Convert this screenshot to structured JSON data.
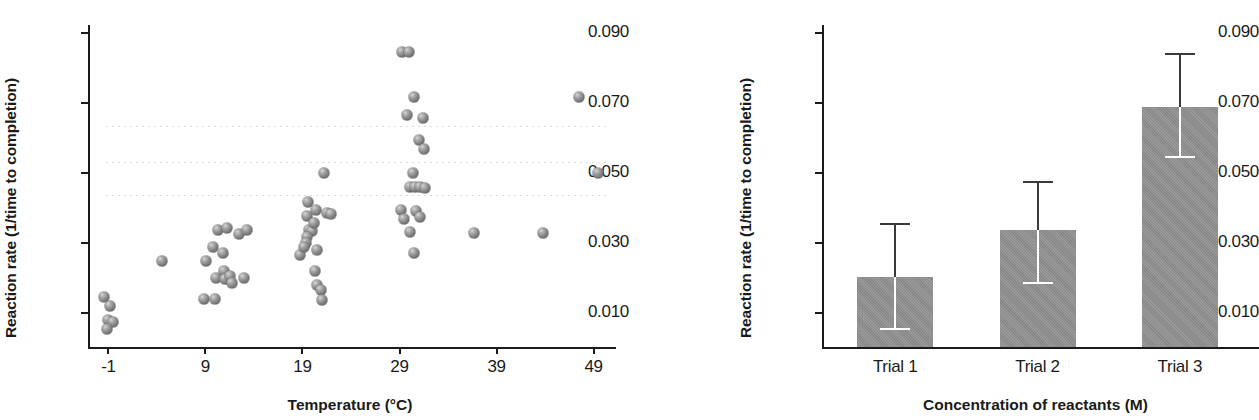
{
  "chart_data": [
    {
      "type": "scatter",
      "panel": "left",
      "title": "",
      "xlabel": "Temperature (°C)",
      "ylabel": "Reaction rate (1/time to completion)",
      "xticks": [
        "-1",
        "9",
        "19",
        "29",
        "39",
        "49"
      ],
      "xtick_values": [
        -1,
        9,
        19,
        29,
        39,
        49
      ],
      "yticks": [
        "0.010",
        "0.030",
        "0.050",
        "0.070",
        "0.090"
      ],
      "ytick_values": [
        0.01,
        0.03,
        0.05,
        0.07,
        0.09
      ],
      "xlim": [
        -3,
        51
      ],
      "ylim": [
        0.0,
        0.092
      ],
      "grid": false,
      "legend": "none",
      "marker": "gray-sphere",
      "points": [
        {
          "x": -1.4,
          "y": 0.0143
        },
        {
          "x": -0.7,
          "y": 0.0116
        },
        {
          "x": -0.9,
          "y": 0.0078
        },
        {
          "x": -0.4,
          "y": 0.0072
        },
        {
          "x": -1.0,
          "y": 0.0051
        },
        {
          "x": 4.6,
          "y": 0.0246
        },
        {
          "x": 8.9,
          "y": 0.0137
        },
        {
          "x": 9.2,
          "y": 0.0245
        },
        {
          "x": 9.9,
          "y": 0.0287
        },
        {
          "x": 10.4,
          "y": 0.0334
        },
        {
          "x": 10.9,
          "y": 0.0269
        },
        {
          "x": 11.3,
          "y": 0.0339
        },
        {
          "x": 11.0,
          "y": 0.0218
        },
        {
          "x": 10.2,
          "y": 0.0196
        },
        {
          "x": 11.1,
          "y": 0.0194
        },
        {
          "x": 11.6,
          "y": 0.0204
        },
        {
          "x": 11.8,
          "y": 0.0184
        },
        {
          "x": 12.6,
          "y": 0.0322
        },
        {
          "x": 13.1,
          "y": 0.0196
        },
        {
          "x": 13.4,
          "y": 0.0335
        },
        {
          "x": 10.1,
          "y": 0.0136
        },
        {
          "x": 18.8,
          "y": 0.0262
        },
        {
          "x": 19.7,
          "y": 0.0414
        },
        {
          "x": 19.6,
          "y": 0.0374
        },
        {
          "x": 20.5,
          "y": 0.0392
        },
        {
          "x": 19.8,
          "y": 0.0335
        },
        {
          "x": 20.1,
          "y": 0.0331
        },
        {
          "x": 20.3,
          "y": 0.0353
        },
        {
          "x": 19.6,
          "y": 0.0313
        },
        {
          "x": 19.5,
          "y": 0.0296
        },
        {
          "x": 19.3,
          "y": 0.0286
        },
        {
          "x": 20.6,
          "y": 0.0278
        },
        {
          "x": 20.4,
          "y": 0.0217
        },
        {
          "x": 20.6,
          "y": 0.0177
        },
        {
          "x": 21.0,
          "y": 0.0162
        },
        {
          "x": 21.1,
          "y": 0.0135
        },
        {
          "x": 21.3,
          "y": 0.0496
        },
        {
          "x": 21.6,
          "y": 0.0383
        },
        {
          "x": 22.0,
          "y": 0.0379
        },
        {
          "x": 29.4,
          "y": 0.0842
        },
        {
          "x": 30.1,
          "y": 0.0842
        },
        {
          "x": 30.6,
          "y": 0.0714
        },
        {
          "x": 29.9,
          "y": 0.0664
        },
        {
          "x": 31.5,
          "y": 0.0655
        },
        {
          "x": 31.1,
          "y": 0.0592
        },
        {
          "x": 31.6,
          "y": 0.0566
        },
        {
          "x": 30.5,
          "y": 0.0498
        },
        {
          "x": 30.2,
          "y": 0.0457
        },
        {
          "x": 30.7,
          "y": 0.0456
        },
        {
          "x": 31.2,
          "y": 0.0456
        },
        {
          "x": 31.7,
          "y": 0.0455
        },
        {
          "x": 29.3,
          "y": 0.0391
        },
        {
          "x": 30.8,
          "y": 0.0388
        },
        {
          "x": 29.6,
          "y": 0.0366
        },
        {
          "x": 31.2,
          "y": 0.0373
        },
        {
          "x": 30.2,
          "y": 0.033
        },
        {
          "x": 30.6,
          "y": 0.0268
        },
        {
          "x": 36.8,
          "y": 0.0327
        },
        {
          "x": 43.9,
          "y": 0.0326
        },
        {
          "x": 47.6,
          "y": 0.0713
        },
        {
          "x": 49.6,
          "y": 0.0496
        }
      ],
      "scan_artifacts": [
        0.0632,
        0.0528,
        0.0433
      ]
    },
    {
      "type": "bar",
      "panel": "right",
      "title": "",
      "xlabel": "Concentration of reactants (M)",
      "ylabel": "Reaction rate (1/time to completion)",
      "categories": [
        "Trial 1",
        "Trial 2",
        "Trial 3"
      ],
      "values": [
        0.02,
        0.0335,
        0.0685
      ],
      "error_upper": [
        0.0355,
        0.0475,
        0.084
      ],
      "error_lower": [
        0.0055,
        0.0185,
        0.0545
      ],
      "yticks": [
        "0.010",
        "0.030",
        "0.050",
        "0.070",
        "0.090"
      ],
      "ytick_values": [
        0.01,
        0.03,
        0.05,
        0.07,
        0.09
      ],
      "ylim": [
        0.0,
        0.092
      ],
      "grid": false,
      "legend": "none",
      "bar_color": "#8e8e8e"
    }
  ],
  "scatter": {
    "ylabel": "Reaction rate (1/time to completion)",
    "xlabel": "Temperature (°C)"
  },
  "bars": {
    "ylabel": "Reaction rate (1/time to completion)",
    "xlabel": "Concentration of reactants (M)"
  }
}
